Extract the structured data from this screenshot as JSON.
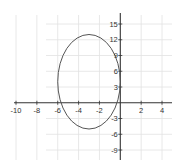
{
  "chart_data": {
    "type": "line",
    "title": "",
    "xlabel": "",
    "ylabel": "",
    "xlim": [
      -10,
      5
    ],
    "ylim": [
      -10,
      17
    ],
    "grid": true,
    "x_ticks": [
      -10,
      -8,
      -6,
      -4,
      -2,
      2,
      4
    ],
    "y_ticks": [
      15,
      12,
      9,
      6,
      3,
      -3,
      -6,
      -9
    ],
    "x_tick_labels": [
      "-10",
      "-8",
      "-6",
      "-4",
      "-2",
      "2",
      "4"
    ],
    "y_tick_labels": [
      "15",
      "12",
      "9",
      "6",
      "3",
      "-3",
      "-6",
      "-9"
    ],
    "series": [
      {
        "name": "ellipse",
        "shape": "ellipse",
        "center": [
          -3,
          4
        ],
        "semi_axis_x": 3,
        "semi_axis_y": 9,
        "equation": "(x+3)^2/9 + (y-4)^2/81 = 1",
        "color": "#555555"
      }
    ]
  },
  "colors": {
    "axis": "#333333",
    "grid": "#e2e2e2",
    "curve": "#555555",
    "background": "#ffffff"
  }
}
